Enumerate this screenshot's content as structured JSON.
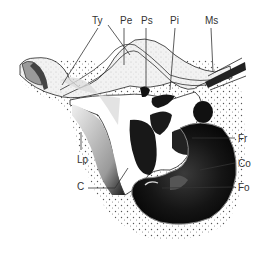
{
  "figure": {
    "type": "anatomical-diagram",
    "labels": [
      {
        "id": "ty",
        "text": "Ty",
        "x": 92,
        "y": 16
      },
      {
        "id": "pe",
        "text": "Pe",
        "x": 120,
        "y": 16
      },
      {
        "id": "ps",
        "text": "Ps",
        "x": 141,
        "y": 16
      },
      {
        "id": "pi",
        "text": "Pi",
        "x": 170,
        "y": 16
      },
      {
        "id": "ms",
        "text": "Ms",
        "x": 205,
        "y": 16
      },
      {
        "id": "lp",
        "text": "Lp",
        "x": 77,
        "y": 155
      },
      {
        "id": "fr",
        "text": "Fr",
        "x": 238,
        "y": 134
      },
      {
        "id": "c",
        "text": "C",
        "x": 77,
        "y": 182
      },
      {
        "id": "co",
        "text": "Co",
        "x": 238,
        "y": 159
      },
      {
        "id": "fo",
        "text": "Fo",
        "x": 238,
        "y": 183
      }
    ],
    "colors": {
      "ink": "#111111",
      "stipple": "#6a6a6a",
      "light_fill": "#e8e8e8",
      "background": "#ffffff"
    }
  }
}
